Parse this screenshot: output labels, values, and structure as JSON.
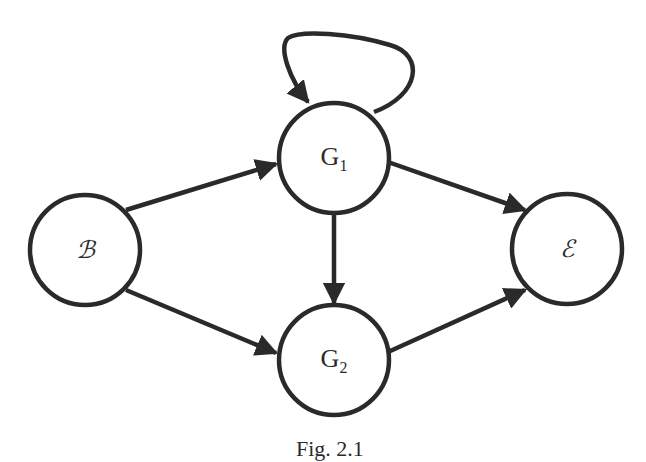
{
  "diagram": {
    "type": "directed-graph",
    "nodes": [
      {
        "id": "B",
        "label": "ℬ",
        "cx": 85,
        "cy": 250
      },
      {
        "id": "G1",
        "label": "G",
        "sub": "1",
        "cx": 334,
        "cy": 160
      },
      {
        "id": "G2",
        "label": "G",
        "sub": "2",
        "cx": 334,
        "cy": 360
      },
      {
        "id": "E",
        "label": "ℰ",
        "cx": 567,
        "cy": 249
      }
    ],
    "edges": [
      {
        "from": "B",
        "to": "G1"
      },
      {
        "from": "B",
        "to": "G2"
      },
      {
        "from": "G1",
        "to": "G1",
        "kind": "self-loop"
      },
      {
        "from": "G1",
        "to": "G2"
      },
      {
        "from": "G1",
        "to": "E"
      },
      {
        "from": "G2",
        "to": "E"
      }
    ],
    "caption": "Fig. 2.1"
  }
}
